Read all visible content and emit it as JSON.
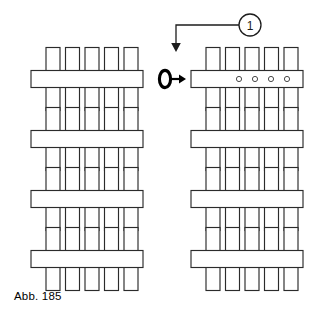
{
  "figure": {
    "caption": "Abb. 185",
    "background_color": "#ffffff",
    "line_color": "#2b2b2b",
    "accent_color": "#000000",
    "width": 332,
    "height": 315
  },
  "callout": {
    "label": "1",
    "balloon_shape": "circle",
    "balloon_center_x": 250,
    "balloon_center_y": 25,
    "balloon_radius": 11,
    "leader_points": "250,25 176,25 176,44",
    "arrow_tip_x": 176,
    "arrow_tip_y": 50,
    "arrow_direction": "down",
    "points_to": "right-column-row-1"
  },
  "transform_symbol": {
    "name": "rotate-then-arrow",
    "ellipse_center_x": 165,
    "ellipse_center_y": 79,
    "ellipse_rx": 5.6,
    "ellipse_ry": 8.6,
    "arrow_start_x": 172,
    "arrow_end_x": 186,
    "arrow_y": 79,
    "arrow_direction": "right"
  },
  "geometry": {
    "column_x": [
      31,
      191
    ],
    "row_y": [
      79,
      139,
      199,
      259
    ],
    "bar_width": 112,
    "bar_height": 17,
    "tooth_width": 14,
    "tooth_height": 23,
    "tooth_count_per_side": 5,
    "tooth_pitch": 19.5,
    "tooth_start_offset": 15,
    "hole_radius": 2.6,
    "hole_offsets_x": [
      48,
      64,
      80,
      96
    ]
  },
  "assemblies": [
    {
      "id": "left-row-1",
      "column": "left",
      "row": 1,
      "label": "comb-assembly",
      "has_holes": false,
      "hole_count": 0,
      "teeth_top": 5,
      "teeth_bottom": 5
    },
    {
      "id": "left-row-2",
      "column": "left",
      "row": 2,
      "label": "comb-assembly",
      "has_holes": false,
      "hole_count": 0,
      "teeth_top": 5,
      "teeth_bottom": 5
    },
    {
      "id": "left-row-3",
      "column": "left",
      "row": 3,
      "label": "comb-assembly",
      "has_holes": false,
      "hole_count": 0,
      "teeth_top": 5,
      "teeth_bottom": 5
    },
    {
      "id": "left-row-4",
      "column": "left",
      "row": 4,
      "label": "comb-assembly",
      "has_holes": false,
      "hole_count": 0,
      "teeth_top": 5,
      "teeth_bottom": 5
    },
    {
      "id": "right-row-1",
      "column": "right",
      "row": 1,
      "label": "comb-assembly-with-holes",
      "has_holes": true,
      "hole_count": 4,
      "teeth_top": 5,
      "teeth_bottom": 5
    },
    {
      "id": "right-row-2",
      "column": "right",
      "row": 2,
      "label": "comb-assembly",
      "has_holes": false,
      "hole_count": 0,
      "teeth_top": 5,
      "teeth_bottom": 5
    },
    {
      "id": "right-row-3",
      "column": "right",
      "row": 3,
      "label": "comb-assembly",
      "has_holes": false,
      "hole_count": 0,
      "teeth_top": 5,
      "teeth_bottom": 5
    },
    {
      "id": "right-row-4",
      "column": "right",
      "row": 4,
      "label": "comb-assembly",
      "has_holes": false,
      "hole_count": 0,
      "teeth_top": 5,
      "teeth_bottom": 5
    }
  ]
}
